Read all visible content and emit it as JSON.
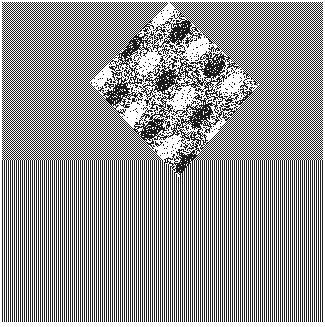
{
  "figure": {
    "width": 325,
    "height": 327,
    "background": "#ffffff",
    "ink": "#1a1a1a",
    "margin": {
      "left": 2,
      "top": 2,
      "right": 2,
      "bottom": 5
    },
    "regions": [
      {
        "name": "checkerboard",
        "y_start": 2,
        "y_end": 160,
        "cell": 2
      },
      {
        "name": "vertical-stripes",
        "y_start": 160,
        "y_end": 322,
        "cell": 2
      }
    ],
    "diamond": {
      "top": [
        168,
        2
      ],
      "right": [
        258,
        84
      ],
      "bottom": [
        178,
        176
      ],
      "left": [
        90,
        82
      ],
      "density": 0.45,
      "light_streaks": 0.3
    }
  }
}
